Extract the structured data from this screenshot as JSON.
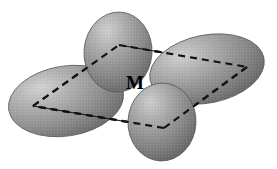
{
  "figure": {
    "background_color": "#ffffff",
    "center_atom": {
      "label": "M",
      "label_color": "#000000",
      "x": 136,
      "y": 84
    },
    "geometry": {
      "name": "square planar",
      "plane_outline": "rhombus drawn in perspective",
      "solid_edge_color": "#111111",
      "dashed_edge_color": "#111111",
      "dash_pattern": "7 5"
    },
    "plane_vertices": [
      {
        "name": "left-vertex",
        "x": 33,
        "y": 106
      },
      {
        "name": "top-vertex",
        "x": 119,
        "y": 45
      },
      {
        "name": "right-vertex",
        "x": 247,
        "y": 67
      },
      {
        "name": "bottom-vertex",
        "x": 164,
        "y": 128
      }
    ],
    "plane_edges": [
      {
        "name": "edge-left-to-top",
        "from": "left-vertex",
        "to": "top-vertex",
        "style": "dashed"
      },
      {
        "name": "edge-top-to-right",
        "from": "top-vertex",
        "to": "right-vertex",
        "style": "dashed"
      },
      {
        "name": "edge-right-to-bottom",
        "from": "right-vertex",
        "to": "bottom-vertex",
        "style": "dashed"
      },
      {
        "name": "edge-bottom-to-left",
        "from": "bottom-vertex",
        "to": "left-vertex",
        "style": "dashed"
      },
      {
        "name": "edge-top-to-right-solid",
        "from": "top-vertex",
        "to": "right-vertex",
        "style": "solid"
      },
      {
        "name": "edge-bottom-to-left-solid",
        "from": "bottom-vertex",
        "to": "left-vertex",
        "style": "solid"
      }
    ],
    "lobes": [
      {
        "name": "orbital-lobe-left",
        "cx": 66,
        "cy": 101,
        "rx": 58,
        "ry": 35,
        "rotation": -9,
        "fill_light": "#c9c9c9",
        "fill_mid": "#9a9a9a",
        "fill_dark": "#6f6f6f",
        "edge_color": "#5a5a5a",
        "highlight_x": 40,
        "highlight_y": 88,
        "z": 1
      },
      {
        "name": "orbital-lobe-top",
        "cx": 118,
        "cy": 52,
        "rx": 34,
        "ry": 40,
        "rotation": 4,
        "fill_light": "#c4c4c4",
        "fill_mid": "#949494",
        "fill_dark": "#686868",
        "edge_color": "#565656",
        "highlight_x": 103,
        "highlight_y": 33,
        "z": 2
      },
      {
        "name": "orbital-lobe-right",
        "cx": 207,
        "cy": 69,
        "rx": 58,
        "ry": 34,
        "rotation": -11,
        "fill_light": "#c6c6c6",
        "fill_mid": "#969696",
        "fill_dark": "#6b6b6b",
        "edge_color": "#585858",
        "highlight_x": 183,
        "highlight_y": 52,
        "z": 3
      },
      {
        "name": "orbital-lobe-bottom",
        "cx": 162,
        "cy": 122,
        "rx": 34,
        "ry": 39,
        "rotation": 3,
        "fill_light": "#c2c2c2",
        "fill_mid": "#929292",
        "fill_dark": "#676767",
        "edge_color": "#545454",
        "highlight_x": 147,
        "highlight_y": 104,
        "z": 4
      }
    ]
  }
}
